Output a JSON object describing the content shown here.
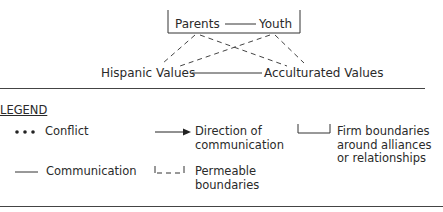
{
  "diagram": {
    "nodes": {
      "parents": "Parents",
      "youth": "Youth",
      "hispanic_values": "Hispanic Values",
      "acculturated_values": "Acculturated Values"
    },
    "edges": [
      {
        "from": "Parents",
        "to": "Youth",
        "type": "communication"
      },
      {
        "from": "Hispanic Values",
        "to": "Acculturated Values",
        "type": "communication"
      },
      {
        "from": "Parents",
        "to": "Hispanic Values",
        "type": "permeable"
      },
      {
        "from": "Parents",
        "to": "Acculturated Values",
        "type": "permeable"
      },
      {
        "from": "Youth",
        "to": "Hispanic Values",
        "type": "permeable"
      },
      {
        "from": "Youth",
        "to": "Acculturated Values",
        "type": "permeable"
      }
    ],
    "boundaries": [
      {
        "around": [
          "Parents",
          "Youth"
        ],
        "type": "firm"
      }
    ]
  },
  "legend": {
    "title": "LEGEND",
    "items": [
      {
        "symbol": "dots",
        "label": "Conflict"
      },
      {
        "symbol": "arrow",
        "label_line1": "Direction of",
        "label_line2": "communication"
      },
      {
        "symbol": "firm-bracket",
        "label_line1": "Firm boundaries",
        "label_line2": "around alliances",
        "label_line3": "or relationships"
      },
      {
        "symbol": "solid-line",
        "label": "Communication"
      },
      {
        "symbol": "dashed-bracket",
        "label_line1": "Permeable",
        "label_line2": "boundaries"
      }
    ]
  }
}
